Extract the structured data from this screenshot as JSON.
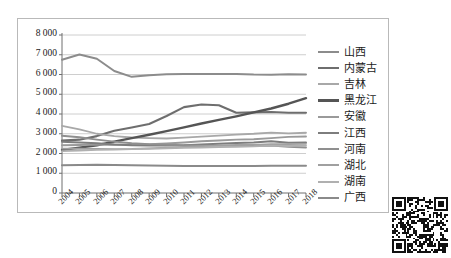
{
  "chart_data": {
    "type": "line",
    "title": "",
    "xlabel": "",
    "ylabel": "",
    "grid": true,
    "legend_position": "right",
    "ylim": [
      0,
      8000
    ],
    "yticks": [
      "0",
      "1 000",
      "2 000",
      "3 000",
      "4 000",
      "5 000",
      "6 000",
      "7 000",
      "8 000"
    ],
    "ytick_values": [
      0,
      1000,
      2000,
      3000,
      4000,
      5000,
      6000,
      7000,
      8000
    ],
    "categories": [
      "2004",
      "2005",
      "2006",
      "2007",
      "2008",
      "2009",
      "2010",
      "2011",
      "2012",
      "2013",
      "2014",
      "2015",
      "2016",
      "2017",
      "2018"
    ],
    "series": [
      {
        "name": "山西",
        "color": "#8c8c8c",
        "width": 2.0,
        "values": [
          6750,
          7010,
          6800,
          6180,
          5880,
          5960,
          6010,
          6020,
          6030,
          6030,
          6030,
          6000,
          5990,
          6010,
          6000
        ]
      },
      {
        "name": "内蒙古",
        "color": "#6e6e6e",
        "width": 2.1,
        "values": [
          2650,
          2700,
          2880,
          3150,
          3320,
          3490,
          3900,
          4350,
          4480,
          4440,
          4060,
          4080,
          4100,
          4060,
          4060
        ]
      },
      {
        "name": "吉林",
        "color": "#a8a8a8",
        "width": 1.8,
        "values": [
          3400,
          3220,
          3000,
          2880,
          2810,
          2780,
          2760,
          2800,
          2850,
          2900,
          2960,
          3000,
          3060,
          3020,
          3050
        ]
      },
      {
        "name": "黑龙江",
        "color": "#555555",
        "width": 2.4,
        "values": [
          2180,
          2300,
          2420,
          2600,
          2780,
          2950,
          3130,
          3320,
          3520,
          3700,
          3880,
          4080,
          4280,
          4520,
          4800
        ]
      },
      {
        "name": "安徽",
        "color": "#9a9a9a",
        "width": 1.9,
        "values": [
          2420,
          2430,
          2450,
          2440,
          2450,
          2470,
          2510,
          2560,
          2620,
          2660,
          2700,
          2720,
          2780,
          2840,
          2860
        ]
      },
      {
        "name": "江西",
        "color": "#7d7d7d",
        "width": 2.0,
        "values": [
          2600,
          2560,
          2520,
          2460,
          2420,
          2400,
          2400,
          2420,
          2460,
          2500,
          2530,
          2560,
          2620,
          2540,
          2560
        ]
      },
      {
        "name": "河南",
        "color": "#8f8f8f",
        "width": 1.9,
        "values": [
          2900,
          2820,
          2700,
          2600,
          2520,
          2470,
          2440,
          2420,
          2400,
          2400,
          2400,
          2390,
          2400,
          2340,
          2300
        ]
      },
      {
        "name": "湖北",
        "color": "#a0a0a0",
        "width": 1.8,
        "values": [
          2250,
          2240,
          2230,
          2220,
          2230,
          2260,
          2300,
          2330,
          2370,
          2400,
          2430,
          2440,
          2470,
          2470,
          2490
        ]
      },
      {
        "name": "湖南",
        "color": "#b0b0b0",
        "width": 1.8,
        "values": [
          2120,
          2150,
          2180,
          2200,
          2220,
          2240,
          2260,
          2280,
          2300,
          2320,
          2340,
          2360,
          2400,
          2380,
          2400
        ]
      },
      {
        "name": "广西",
        "color": "#8a8a8a",
        "width": 2.0,
        "values": [
          1400,
          1420,
          1430,
          1420,
          1400,
          1390,
          1380,
          1370,
          1370,
          1370,
          1370,
          1370,
          1380,
          1380,
          1380
        ]
      }
    ]
  },
  "decoration": {
    "qr_label": "qr-code"
  }
}
